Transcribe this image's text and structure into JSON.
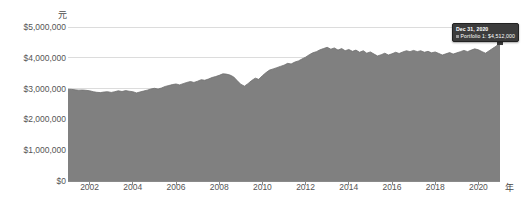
{
  "chart_data": {
    "type": "area",
    "title": "",
    "subtitle": "",
    "xlabel": "年",
    "ylabel": "元",
    "xlim": [
      2001.0,
      2021.0
    ],
    "ylim": [
      0,
      5000000
    ],
    "grid": true,
    "legend_position": "none",
    "y_ticks": [
      {
        "value": 5000000,
        "label": "$5,000,000"
      },
      {
        "value": 4000000,
        "label": "$4,000,000"
      },
      {
        "value": 3000000,
        "label": "$3,000,000"
      },
      {
        "value": 2000000,
        "label": "$2,000,000"
      },
      {
        "value": 1000000,
        "label": "$1,000,000"
      },
      {
        "value": 0,
        "label": "$0"
      }
    ],
    "x_ticks": [
      {
        "value": 2002,
        "label": "2002"
      },
      {
        "value": 2004,
        "label": "2004"
      },
      {
        "value": 2006,
        "label": "2006"
      },
      {
        "value": 2008,
        "label": "2008"
      },
      {
        "value": 2010,
        "label": "2010"
      },
      {
        "value": 2012,
        "label": "2012"
      },
      {
        "value": 2014,
        "label": "2014"
      },
      {
        "value": 2016,
        "label": "2016"
      },
      {
        "value": 2018,
        "label": "2018"
      },
      {
        "value": 2020,
        "label": "2020"
      }
    ],
    "series": [
      {
        "name": "Portfolio 1",
        "color": "#808080",
        "x": [
          2001.0,
          2001.17,
          2001.33,
          2001.5,
          2001.67,
          2001.83,
          2002.0,
          2002.17,
          2002.33,
          2002.5,
          2002.67,
          2002.83,
          2003.0,
          2003.17,
          2003.33,
          2003.5,
          2003.67,
          2003.83,
          2004.0,
          2004.17,
          2004.33,
          2004.5,
          2004.67,
          2004.83,
          2005.0,
          2005.17,
          2005.33,
          2005.5,
          2005.67,
          2005.83,
          2006.0,
          2006.17,
          2006.33,
          2006.5,
          2006.67,
          2006.83,
          2007.0,
          2007.17,
          2007.33,
          2007.5,
          2007.67,
          2007.83,
          2008.0,
          2008.17,
          2008.33,
          2008.5,
          2008.67,
          2008.83,
          2009.0,
          2009.17,
          2009.33,
          2009.5,
          2009.67,
          2009.83,
          2010.0,
          2010.17,
          2010.33,
          2010.5,
          2010.67,
          2010.83,
          2011.0,
          2011.17,
          2011.33,
          2011.5,
          2011.67,
          2011.83,
          2012.0,
          2012.17,
          2012.33,
          2012.5,
          2012.67,
          2012.83,
          2013.0,
          2013.17,
          2013.33,
          2013.5,
          2013.67,
          2013.83,
          2014.0,
          2014.17,
          2014.33,
          2014.5,
          2014.67,
          2014.83,
          2015.0,
          2015.17,
          2015.33,
          2015.5,
          2015.67,
          2015.83,
          2016.0,
          2016.17,
          2016.33,
          2016.5,
          2016.67,
          2016.83,
          2017.0,
          2017.17,
          2017.33,
          2017.5,
          2017.67,
          2017.83,
          2018.0,
          2018.17,
          2018.33,
          2018.5,
          2018.67,
          2018.83,
          2019.0,
          2019.17,
          2019.33,
          2019.5,
          2019.67,
          2019.83,
          2020.0,
          2020.17,
          2020.33,
          2020.5,
          2020.67,
          2020.83,
          2021.0
        ],
        "values": [
          2980000,
          2975000,
          2960000,
          2950000,
          2955000,
          2945000,
          2930000,
          2900000,
          2880000,
          2870000,
          2890000,
          2900000,
          2875000,
          2900000,
          2930000,
          2905000,
          2935000,
          2915000,
          2900000,
          2860000,
          2890000,
          2920000,
          2950000,
          2985000,
          3010000,
          2985000,
          3020000,
          3070000,
          3100000,
          3130000,
          3150000,
          3120000,
          3160000,
          3200000,
          3230000,
          3200000,
          3240000,
          3290000,
          3270000,
          3310000,
          3360000,
          3390000,
          3430000,
          3480000,
          3470000,
          3440000,
          3380000,
          3260000,
          3140000,
          3080000,
          3160000,
          3260000,
          3340000,
          3300000,
          3420000,
          3520000,
          3600000,
          3640000,
          3680000,
          3720000,
          3760000,
          3820000,
          3800000,
          3860000,
          3900000,
          3960000,
          4020000,
          4100000,
          4160000,
          4200000,
          4260000,
          4300000,
          4340000,
          4280000,
          4320000,
          4250000,
          4300000,
          4230000,
          4270000,
          4210000,
          4250000,
          4180000,
          4230000,
          4150000,
          4190000,
          4120000,
          4060000,
          4100000,
          4150000,
          4090000,
          4130000,
          4180000,
          4140000,
          4190000,
          4230000,
          4200000,
          4240000,
          4200000,
          4230000,
          4180000,
          4210000,
          4160000,
          4190000,
          4140000,
          4090000,
          4130000,
          4170000,
          4120000,
          4160000,
          4200000,
          4240000,
          4200000,
          4250000,
          4290000,
          4260000,
          4200000,
          4150000,
          4230000,
          4310000,
          4380000,
          4512000
        ]
      }
    ],
    "annotations": [
      {
        "type": "tooltip",
        "date": "Dec 31, 2020",
        "series_name": "Portfolio 1",
        "value_label": "$4,512,000",
        "row_text": "Portfolio 1: $4,512,000",
        "marker_x": 2021.0,
        "marker_y": 4512000
      }
    ]
  },
  "colors": {
    "area_fill": "#808080",
    "area_stroke": "#6e6e6e",
    "gridline": "#dcdcdc",
    "axis": "#8a8a8a",
    "tick_text": "#555555",
    "unit_text": "#4a4a4a",
    "tooltip_bg": "#3c3c3c",
    "tooltip_text": "#ffffff",
    "marker": "#3c3c3c",
    "background": "#ffffff"
  }
}
